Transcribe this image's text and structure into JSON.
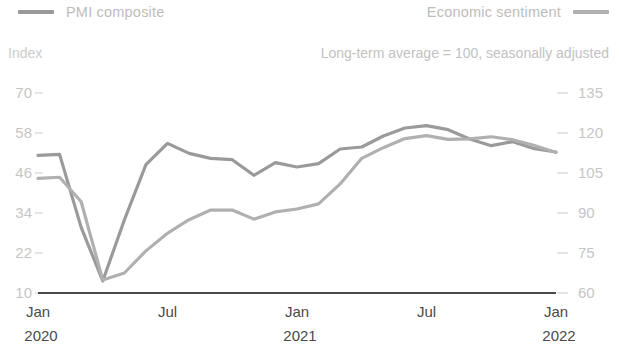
{
  "legend": {
    "left": {
      "label": "PMI composite",
      "swatch_name": "pmi-composite-swatch",
      "color": "#9a9a9a"
    },
    "right": {
      "label": "Economic sentiment",
      "swatch_name": "economic-sentiment-swatch",
      "color": "#b0b0b0"
    }
  },
  "header": {
    "unit_label": "Index",
    "note": "Long-term average = 100, seasonally adjusted"
  },
  "chart_data": {
    "type": "line",
    "title": "",
    "subtitle": "Long-term average = 100, seasonally adjusted",
    "xlabel": "",
    "ylabel": "Index",
    "grid": false,
    "legend_position": "top",
    "x": [
      "Jan 2020",
      "Feb 2020",
      "Mar 2020",
      "Apr 2020",
      "May 2020",
      "Jun 2020",
      "Jul 2020",
      "Aug 2020",
      "Sep 2020",
      "Oct 2020",
      "Nov 2020",
      "Dec 2020",
      "Jan 2021",
      "Feb 2021",
      "Mar 2021",
      "Apr 2021",
      "May 2021",
      "Jun 2021",
      "Jul 2021",
      "Aug 2021",
      "Sep 2021",
      "Oct 2021",
      "Nov 2021",
      "Dec 2021",
      "Jan 2022"
    ],
    "xtick_labels": [
      "Jan",
      "Jul",
      "Jan",
      "Jul",
      "Jan"
    ],
    "xtick_years": [
      "2020",
      "",
      "2021",
      "",
      "2022"
    ],
    "xtick_index": [
      0,
      6,
      12,
      18,
      24
    ],
    "axes": [
      {
        "id": "left",
        "name": "PMI composite index",
        "ticks": [
          70,
          58,
          46,
          34,
          22,
          10
        ],
        "range": [
          10,
          70
        ],
        "side": "left"
      },
      {
        "id": "right",
        "name": "Economic sentiment index",
        "ticks": [
          135,
          120,
          105,
          90,
          75,
          60
        ],
        "range": [
          60,
          135
        ],
        "side": "right"
      }
    ],
    "series": [
      {
        "name": "PMI composite",
        "axis": "left",
        "color": "#9a9a9a",
        "values": [
          51.3,
          51.6,
          29.7,
          13.6,
          31.9,
          48.5,
          54.9,
          51.9,
          50.4,
          50.0,
          45.3,
          49.1,
          47.8,
          48.8,
          53.2,
          53.8,
          57.1,
          59.5,
          60.2,
          59.0,
          56.2,
          54.2,
          55.4,
          53.3,
          52.3
        ]
      },
      {
        "name": "Economic sentiment",
        "axis": "right",
        "color": "#b0b0b0",
        "values": [
          103.0,
          103.4,
          94.2,
          64.9,
          67.5,
          75.8,
          82.4,
          87.5,
          91.1,
          91.1,
          87.7,
          90.4,
          91.5,
          93.4,
          100.9,
          110.5,
          114.5,
          117.9,
          119.0,
          117.6,
          117.8,
          118.6,
          117.5,
          115.3,
          112.7
        ]
      }
    ]
  }
}
